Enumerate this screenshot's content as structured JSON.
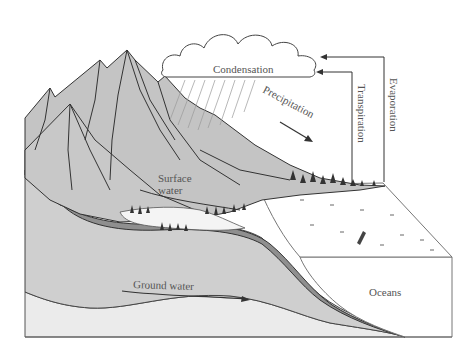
{
  "diagram": {
    "labels": {
      "condensation": "Condensation",
      "precipitation": "Precipitation",
      "transpiration": "Transpiration",
      "evaporation": "Evaporation",
      "surface_water_line1": "Surface",
      "surface_water_line2": "water",
      "ground_water": "Ground water",
      "oceans": "Oceans"
    },
    "colors": {
      "background": "#ffffff",
      "ground": "#cfcfcf",
      "mountain": "#c4c4c4",
      "dark_layer": "#8f8f8f",
      "bedrock": "#ebebeb",
      "ocean": "#ffffff",
      "line": "#333333",
      "text": "#555555"
    }
  }
}
